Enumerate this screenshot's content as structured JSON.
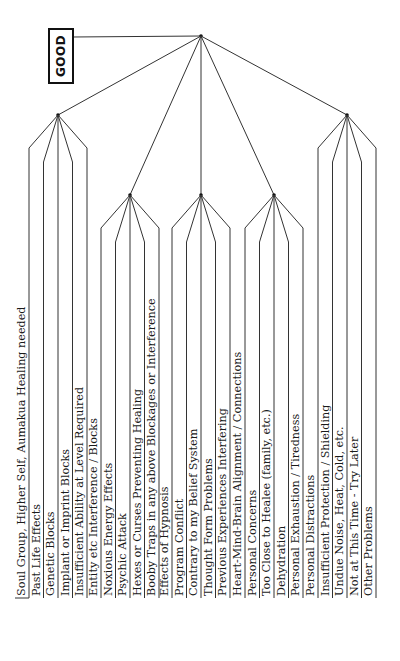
{
  "diagram": {
    "root_label": "GOOD",
    "line_color": "#333333",
    "groups": [
      {
        "name": "group-1",
        "items": [
          "Soul Group, Higher Self, Aumakua Healing needed",
          "Past Life Effects",
          "Genetic Blocks",
          "Implant or Imprint Blocks",
          "Insufficient Ability at Level Required"
        ]
      },
      {
        "name": "group-2",
        "items": [
          "Entity etc Interference / Blocks",
          "Noxious Energy Effects",
          "Psychic Attack",
          "Hexes or Curses Preventing Healing",
          "Booby Traps in any above Blockages or Interference"
        ]
      },
      {
        "name": "group-3",
        "items": [
          "Effects of Hypnosis",
          "Program Conflict",
          "Contrary to my Belief System",
          "Thought Form Problems",
          "Previous Experiences Interfering"
        ]
      },
      {
        "name": "group-4",
        "items": [
          "Heart-Mind-Brain Alignment / Connections",
          "Personal Concerns",
          "Too Close to Healee (family, etc.)",
          "Dehydration",
          "Personal Exhaustion / Tiredness"
        ]
      },
      {
        "name": "group-5",
        "items": [
          "Personal Distractions",
          "Insufficient Protection / Shielding",
          "Undue Noise, Heat, Cold, etc.",
          "Not at This Time - Try Later",
          "Other Problems"
        ]
      }
    ]
  }
}
